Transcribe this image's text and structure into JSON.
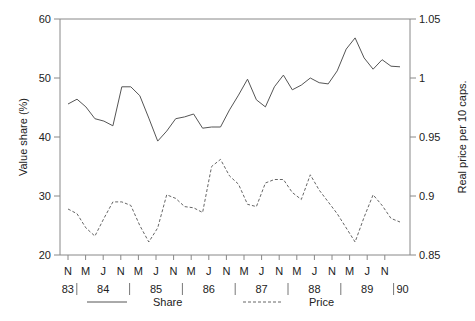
{
  "chart_data": {
    "type": "line",
    "title": "",
    "xlabel": "",
    "ylabel": "Value share (%)",
    "y2label": "Real price per 10 caps.",
    "ylim": [
      20,
      60
    ],
    "y2lim": [
      0.85,
      1.05
    ],
    "yticks": [
      "20",
      "30",
      "40",
      "50",
      "60"
    ],
    "y2ticks": [
      "0.85",
      "0.9",
      "0.95",
      "1",
      "1.05"
    ],
    "xtick_months": [
      "N",
      "M",
      "J",
      "N",
      "M",
      "J",
      "N",
      "M",
      "J",
      "N",
      "M",
      "J",
      "N",
      "M",
      "J",
      "N",
      "M",
      "J",
      "N"
    ],
    "xtick_years": [
      "83",
      "84",
      "85",
      "86",
      "87",
      "88",
      "89",
      "90"
    ],
    "legend": [
      {
        "name": "Share",
        "style": "solid"
      },
      {
        "name": "Price",
        "style": "dashed"
      }
    ],
    "legend_position": "bottom",
    "grid": false,
    "x": [
      "Nov83",
      "Dec83",
      "Jan84",
      "Feb84",
      "Mar84",
      "Apr84",
      "May84",
      "Jun84",
      "Jul84",
      "Aug84",
      "Sep84",
      "Oct84",
      "Nov84",
      "Dec84",
      "Jan85",
      "Feb85",
      "Mar85",
      "Apr85",
      "May85",
      "Jun85",
      "Jul85",
      "Aug85",
      "Sep85",
      "Oct85",
      "Nov85",
      "Dec85",
      "Jan86",
      "Feb86",
      "Mar86",
      "Apr86",
      "May86",
      "Jun86",
      "Jul86",
      "Aug86",
      "Sep86",
      "Oct86",
      "Nov86",
      "Dec86"
    ],
    "series": [
      {
        "name": "Share",
        "axis": "left",
        "values": [
          45.6,
          46.4,
          45.1,
          43.1,
          42.7,
          41.9,
          48.5,
          48.5,
          47.0,
          43.2,
          39.3,
          41.0,
          43.1,
          43.4,
          43.9,
          41.5,
          41.7,
          41.7,
          44.6,
          47.1,
          49.8,
          46.3,
          45.1,
          48.5,
          50.5,
          48.0,
          48.8,
          50.0,
          49.2,
          49.0,
          51.2,
          54.9,
          56.8,
          53.4,
          51.5,
          53.1,
          52.0,
          51.9
        ]
      },
      {
        "name": "Price",
        "axis": "right",
        "values": [
          0.889,
          0.885,
          0.873,
          0.866,
          0.881,
          0.895,
          0.895,
          0.892,
          0.875,
          0.861,
          0.873,
          0.901,
          0.898,
          0.891,
          0.89,
          0.886,
          0.925,
          0.931,
          0.917,
          0.91,
          0.893,
          0.891,
          0.911,
          0.914,
          0.914,
          0.903,
          0.897,
          0.918,
          0.905,
          0.895,
          0.885,
          0.873,
          0.861,
          0.882,
          0.901,
          0.892,
          0.881,
          0.878
        ]
      }
    ]
  }
}
